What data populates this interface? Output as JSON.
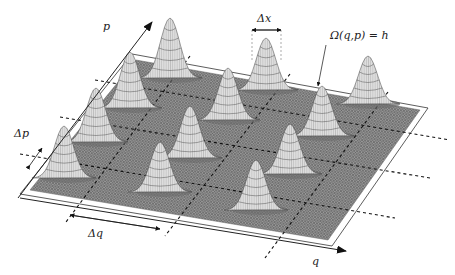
{
  "figure": {
    "type": "3d-surface-lattice",
    "labels": {
      "p_axis": "p",
      "q_axis": "q",
      "delta_p": "Δp",
      "delta_q": "Δq",
      "delta_x": "Δx",
      "surface": "Ω(q,p) = h"
    },
    "colors": {
      "surface": "#8a8a8a",
      "mesh": "#5a5a5a",
      "peak": "#f2f2f2",
      "peak_lines": "#444444",
      "dash": "#111111",
      "axis": "#222222"
    },
    "surface_corners": [
      [
        136,
        60
      ],
      [
        420,
        110
      ],
      [
        328,
        240
      ],
      [
        30,
        190
      ]
    ],
    "axes": {
      "origin": [
        18,
        198
      ],
      "p_end": [
        152,
        22
      ],
      "q_end": [
        346,
        251
      ]
    },
    "grid": {
      "q_lines": 3,
      "p_lines": 4
    },
    "peaks": [
      {
        "x": 170,
        "y": 18,
        "h": 60
      },
      {
        "x": 266,
        "y": 38,
        "h": 52
      },
      {
        "x": 368,
        "y": 56,
        "h": 48
      },
      {
        "x": 130,
        "y": 52,
        "h": 56
      },
      {
        "x": 228,
        "y": 68,
        "h": 52
      },
      {
        "x": 322,
        "y": 86,
        "h": 50
      },
      {
        "x": 96,
        "y": 88,
        "h": 54
      },
      {
        "x": 190,
        "y": 106,
        "h": 52
      },
      {
        "x": 290,
        "y": 124,
        "h": 50
      },
      {
        "x": 64,
        "y": 126,
        "h": 52
      },
      {
        "x": 160,
        "y": 142,
        "h": 50
      },
      {
        "x": 256,
        "y": 160,
        "h": 50
      }
    ]
  }
}
